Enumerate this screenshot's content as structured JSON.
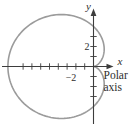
{
  "figure": {
    "labels": {
      "y_axis": "y",
      "x_axis": "x",
      "polar_line1": "Polar",
      "polar_line2": "axis",
      "y_tick": "2",
      "x_tick": "−2"
    },
    "colors": {
      "curve": "#9b9b9b",
      "axis": "#3d3d3d",
      "text": "#2e2e2e",
      "background": "#ffffff"
    }
  },
  "chart_data": {
    "type": "line",
    "curve_shape": "cardioid",
    "cardioid_a": 4,
    "opens": "left",
    "cusp_at_origin": true,
    "y_axis_intercepts": [
      4,
      -4
    ],
    "x_axis_intercepts": [
      0,
      -8
    ],
    "x_tick_values": [
      -8,
      -7,
      -6,
      -5,
      -4,
      -3,
      -2,
      -1
    ],
    "y_tick_values": [
      -3,
      -2,
      -1,
      1,
      2,
      3
    ],
    "labeled_x_tick": -2,
    "labeled_y_tick": 2,
    "grid": false,
    "legend": false
  }
}
